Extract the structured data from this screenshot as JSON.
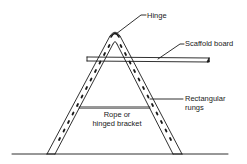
{
  "diagram": {
    "type": "labeled-illustration",
    "labels": {
      "hinge": "Hinge",
      "scaffold_board": "Scaffold board",
      "rungs_line1": "Rectangular",
      "rungs_line2": "rungs",
      "rope_line1": "Rope or",
      "rope_line2": "hinged bracket"
    },
    "colors": {
      "ink": "#1a1a1a",
      "background": "#ffffff"
    }
  }
}
